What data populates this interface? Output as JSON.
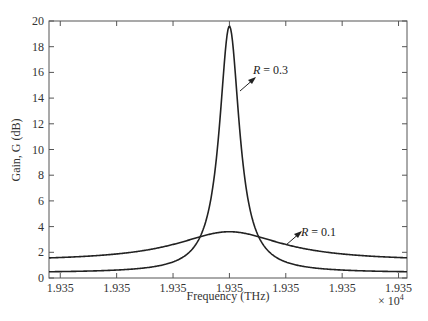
{
  "chart_data": {
    "type": "line",
    "title": "",
    "xlabel": "Frequency (THz)",
    "ylabel": "Gain, G (dB)",
    "x_multiplier_label": "× 10",
    "x_multiplier_exp": "4",
    "ylim": [
      0,
      20
    ],
    "yticks": [
      0,
      2,
      4,
      6,
      8,
      10,
      12,
      14,
      16,
      18,
      20
    ],
    "xtick_labels": [
      "1.935",
      "1.935",
      "1.935",
      "1.935",
      "1.935",
      "1.935",
      "1.935"
    ],
    "x_normalized_ticks": [
      -3,
      -2,
      -1,
      0,
      1,
      2,
      3
    ],
    "xlim_normalized": [
      -3.2,
      3.15
    ],
    "grid": false,
    "legend": "none (inline annotations)",
    "series": [
      {
        "name": "R = 0.3",
        "peak_x": 0,
        "peak_gain_db": 19.6,
        "baseline_gain_db": 0.4,
        "x": [
          -3.2,
          -3,
          -2,
          -1.5,
          -1,
          -0.6,
          -0.4,
          -0.2,
          -0.1,
          0,
          0.1,
          0.2,
          0.4,
          0.6,
          1,
          1.5,
          2,
          3,
          3.15
        ],
        "values": [
          0.4,
          0.45,
          0.7,
          1.1,
          2.3,
          4.5,
          7.3,
          13.0,
          17.5,
          19.6,
          17.5,
          13.0,
          7.3,
          4.5,
          2.3,
          1.1,
          0.7,
          0.45,
          0.4
        ]
      },
      {
        "name": "R = 0.1",
        "peak_x": 0,
        "peak_gain_db": 3.6,
        "baseline_gain_db": 1.3,
        "x": [
          -3.2,
          -3,
          -2,
          -1.5,
          -1,
          -0.5,
          0,
          0.5,
          1,
          1.5,
          2,
          3,
          3.15
        ],
        "values": [
          1.3,
          1.35,
          1.7,
          2.1,
          2.7,
          3.3,
          3.6,
          3.3,
          2.7,
          2.1,
          1.7,
          1.35,
          1.3
        ]
      }
    ],
    "annotations": [
      {
        "text_italic": "R",
        "text_rest": " = 0.3",
        "points_to": "R = 0.3 curve right flank"
      },
      {
        "text_italic": "R",
        "text_rest": " = 0.1",
        "points_to": "R = 0.1 curve right tail"
      }
    ]
  },
  "colors": {
    "curve": "#222222",
    "axis": "#555555",
    "text": "#333333"
  }
}
